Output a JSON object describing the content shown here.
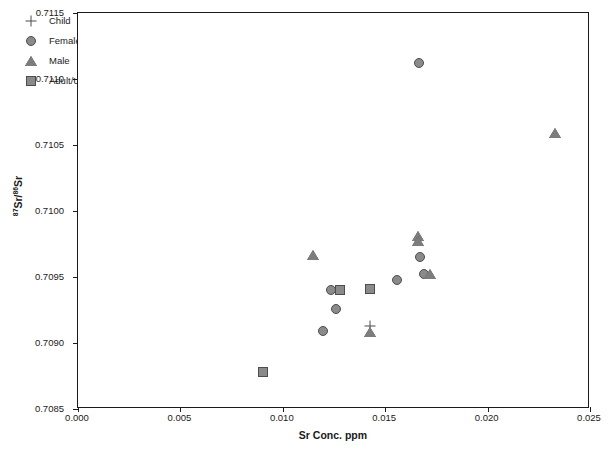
{
  "chart_data": {
    "type": "scatter",
    "title": "",
    "xlabel": "Sr Conc. ppm",
    "ylabel": "87Sr/86Sr",
    "ylabel_sup_1": "87",
    "ylabel_mid": "Sr/",
    "ylabel_sup_2": "86",
    "ylabel_end": "Sr",
    "xlim": [
      0.0,
      0.025
    ],
    "ylim": [
      0.7085,
      0.7115
    ],
    "xticks": [
      "0.000",
      "0.005",
      "0.010",
      "0.015",
      "0.020",
      "0.025"
    ],
    "xtick_values": [
      0.0,
      0.005,
      0.01,
      0.015,
      0.02,
      0.025
    ],
    "yticks": [
      "0.7085",
      "0.7090",
      "0.7095",
      "0.7100",
      "0.7105",
      "0.7110",
      "0.7115"
    ],
    "ytick_values": [
      0.7085,
      0.709,
      0.7095,
      0.71,
      0.7105,
      0.711,
      0.7115
    ],
    "grid": false,
    "legend_position": "top-left",
    "marker_fill": "#8a8a8a",
    "marker_edge": "#4d4d4d",
    "axis_color": "#1a1a1a",
    "series": [
      {
        "name": "Child",
        "marker": "plus",
        "points": [
          {
            "x": 0.01425,
            "y": 0.70913
          }
        ]
      },
      {
        "name": "Female",
        "marker": "circle",
        "points": [
          {
            "x": 0.01233,
            "y": 0.7094
          },
          {
            "x": 0.01198,
            "y": 0.70909
          },
          {
            "x": 0.01262,
            "y": 0.70926
          },
          {
            "x": 0.01558,
            "y": 0.70948
          },
          {
            "x": 0.01672,
            "y": 0.70965
          },
          {
            "x": 0.0169,
            "y": 0.70952
          },
          {
            "x": 0.01665,
            "y": 0.71112
          }
        ]
      },
      {
        "name": "Male",
        "marker": "triangle",
        "points": [
          {
            "x": 0.01147,
            "y": 0.70967
          },
          {
            "x": 0.01425,
            "y": 0.70908
          },
          {
            "x": 0.0166,
            "y": 0.70981
          },
          {
            "x": 0.01662,
            "y": 0.70977
          },
          {
            "x": 0.01718,
            "y": 0.70952
          },
          {
            "x": 0.0233,
            "y": 0.71059
          }
        ]
      },
      {
        "name": "Adult/Unknown",
        "marker": "square",
        "points": [
          {
            "x": 0.01278,
            "y": 0.7094
          },
          {
            "x": 0.01425,
            "y": 0.70941
          },
          {
            "x": 0.00905,
            "y": 0.70878
          }
        ]
      }
    ]
  }
}
